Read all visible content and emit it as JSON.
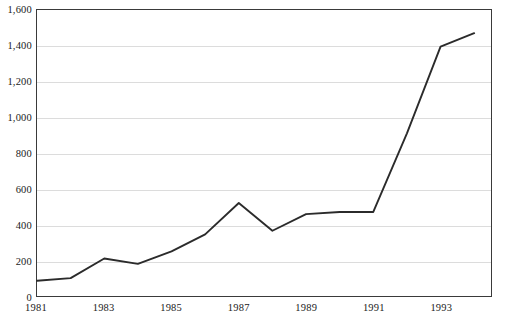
{
  "chart_data": {
    "type": "line",
    "title": "",
    "subtitle": "",
    "xlabel": "",
    "ylabel": "",
    "grid": "horizontal",
    "legend": "none",
    "xlim": [
      1981,
      1994.5
    ],
    "ylim": [
      0,
      1600
    ],
    "x": [
      1981,
      1982,
      1983,
      1984,
      1985,
      1986,
      1987,
      1988,
      1989,
      1990,
      1991,
      1992,
      1993,
      1994
    ],
    "series": [
      {
        "name": "series-1",
        "color": "#2b2b2b",
        "values": [
          85,
          100,
          210,
          180,
          250,
          345,
          520,
          365,
          458,
          470,
          470,
          910,
          1395,
          1470
        ]
      }
    ],
    "y_ticks": [
      0,
      200,
      400,
      600,
      800,
      1000,
      1200,
      1400,
      1600
    ],
    "y_tick_labels": [
      "0",
      "200",
      "400",
      "600",
      "800",
      "1,000",
      "1,200",
      "1,400",
      "1,600"
    ],
    "x_ticks": [
      1981,
      1983,
      1985,
      1987,
      1989,
      1991,
      1993
    ],
    "x_tick_labels": [
      "1981",
      "1983",
      "1985",
      "1987",
      "1989",
      "1991",
      "1993"
    ]
  },
  "style": {
    "grid_color": "#dcdcdc",
    "frame_color": "#3a3a3a",
    "line_color": "#2b2b2b",
    "background": "#ffffff",
    "text_color": "#1a1a1a"
  }
}
